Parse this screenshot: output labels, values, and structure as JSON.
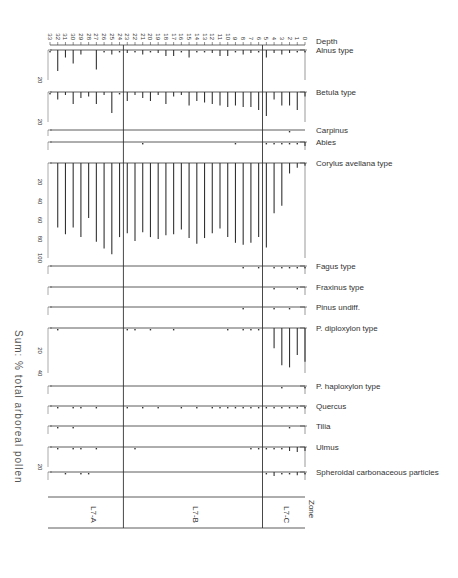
{
  "chart_data": {
    "type": "bar",
    "subtype": "pollen-stratigraphic-diagram (rotated 90°)",
    "depth_axis": {
      "label": "Depth",
      "ticks": [
        33,
        32,
        31,
        30,
        29,
        28,
        27,
        26,
        25,
        24,
        23,
        22,
        21,
        20,
        19,
        18,
        17,
        16,
        15,
        14,
        13,
        12,
        11,
        10,
        9,
        8,
        7,
        6,
        5,
        4,
        3,
        2,
        1,
        0
      ]
    },
    "sum_label": "Sum: % total arboreal pollen",
    "zones": {
      "label": "Zone",
      "items": [
        {
          "name": "L7-A",
          "from_depth": 33,
          "to_depth": 24.5
        },
        {
          "name": "L7-B",
          "from_depth": 24.5,
          "to_depth": 6.5
        },
        {
          "name": "L7-C",
          "from_depth": 6.5,
          "to_depth": 0
        }
      ]
    },
    "series": [
      {
        "name": "Alnus type",
        "scale_max": 20,
        "values": [
          1,
          14,
          5,
          9,
          3,
          0,
          13,
          1,
          3,
          1,
          2,
          1,
          3,
          1,
          2,
          4,
          4,
          1,
          5,
          1,
          1,
          2,
          4,
          4,
          1,
          3,
          2,
          1,
          5,
          2,
          3,
          2,
          1,
          1
        ]
      },
      {
        "name": "Betula type",
        "scale_max": 20,
        "values": [
          1,
          5,
          2,
          8,
          4,
          3,
          8,
          2,
          14,
          1,
          6,
          2,
          4,
          6,
          2,
          8,
          3,
          2,
          9,
          6,
          7,
          8,
          9,
          10,
          9,
          10,
          10,
          12,
          16,
          5,
          9,
          9,
          12,
          3
        ]
      },
      {
        "name": "Carpinus",
        "scale_max": 1,
        "values": [
          0,
          0,
          0,
          0,
          0,
          0,
          0,
          0,
          0,
          0,
          0,
          0,
          0,
          0,
          0,
          0,
          0,
          0,
          0,
          0,
          0,
          0,
          0,
          0,
          0,
          0,
          0,
          0,
          0,
          0,
          0,
          0.3,
          0,
          0
        ]
      },
      {
        "name": "Abies",
        "scale_max": 2,
        "values": [
          0,
          0,
          0,
          0,
          0,
          0,
          0,
          0,
          0,
          0,
          0,
          0,
          0.3,
          0,
          0,
          0,
          0,
          0,
          0,
          0,
          0,
          0,
          0,
          0,
          0.3,
          0,
          0,
          0,
          0.3,
          0.5,
          0.5,
          0.5,
          0.5,
          1
        ]
      },
      {
        "name": "Corylus avellana type",
        "scale_max": 100,
        "values": [
          0,
          68,
          75,
          68,
          78,
          58,
          83,
          90,
          96,
          78,
          74,
          82,
          73,
          78,
          80,
          76,
          75,
          70,
          79,
          85,
          79,
          74,
          69,
          78,
          84,
          86,
          84,
          78,
          89,
          53,
          45,
          11,
          5,
          3
        ]
      },
      {
        "name": "Fagus type",
        "scale_max": 2,
        "values": [
          0,
          0,
          0,
          0,
          0,
          0,
          0,
          0,
          0,
          0,
          0,
          0,
          0,
          0,
          0,
          0,
          0,
          0,
          0,
          0,
          0,
          0,
          0,
          0,
          0,
          0.3,
          0,
          0.3,
          0,
          0.3,
          0.5,
          0.5,
          0.5,
          0.5
        ]
      },
      {
        "name": "Fraxinus type",
        "scale_max": 2,
        "values": [
          0,
          0,
          0,
          0,
          0,
          0,
          0,
          0,
          0,
          0,
          0,
          0,
          0,
          0,
          0,
          0,
          0,
          0,
          0,
          0,
          0,
          0,
          0,
          0,
          0,
          0,
          0,
          0,
          0,
          0.3,
          0,
          0,
          0.3,
          0
        ]
      },
      {
        "name": "Pinus undiff.",
        "scale_max": 2,
        "values": [
          0,
          0,
          0,
          0,
          0,
          0,
          0,
          0,
          0,
          0,
          0,
          0,
          0,
          0,
          0,
          0,
          0,
          0,
          0,
          0,
          0,
          0,
          0,
          0,
          0,
          0.3,
          0,
          0,
          0,
          0.3,
          0,
          0.3,
          0,
          0
        ]
      },
      {
        "name": "P. diploxylon type",
        "scale_max": 40,
        "values": [
          0,
          0.5,
          0,
          0,
          0,
          0,
          0,
          0,
          0,
          0,
          0.5,
          0.5,
          0,
          0.5,
          0,
          0,
          0.5,
          0,
          0,
          0,
          0,
          0,
          0,
          0.5,
          0,
          0.5,
          0.5,
          0.5,
          0,
          18,
          33,
          35,
          24,
          30
        ]
      },
      {
        "name": "P. haploxylon type",
        "scale_max": 2,
        "values": [
          0,
          0,
          0,
          0,
          0,
          0,
          0,
          0,
          0,
          0,
          0,
          0,
          0,
          0,
          0,
          0,
          0,
          0,
          0,
          0,
          0,
          0,
          0,
          0,
          0,
          0,
          0,
          0,
          0,
          0,
          0.3,
          0,
          0,
          0.3
        ]
      },
      {
        "name": "Quercus",
        "scale_max": 2,
        "values": [
          0,
          0.5,
          0,
          0.5,
          0.5,
          0,
          0.3,
          0,
          0,
          0,
          0.5,
          0,
          0.3,
          0,
          0.3,
          0,
          0,
          0.3,
          0,
          0.3,
          0,
          0.3,
          0.3,
          0.3,
          0.5,
          0.5,
          0.3,
          0.5,
          0.5,
          0.5,
          0.3,
          0.5,
          0.5,
          0.5
        ]
      },
      {
        "name": "Tilia",
        "scale_max": 2,
        "values": [
          0,
          0.3,
          0,
          0.3,
          0,
          0,
          0,
          0,
          0,
          0,
          0,
          0,
          0,
          0,
          0,
          0,
          0,
          0,
          0,
          0,
          0,
          0,
          0,
          0,
          0,
          0,
          0,
          0,
          0,
          0,
          0,
          0.3,
          0,
          0
        ]
      },
      {
        "name": "Ulmus",
        "scale_max": 20,
        "values": [
          0,
          0.5,
          0,
          0.5,
          0.5,
          0,
          0.5,
          0,
          0,
          0,
          0,
          0.5,
          0,
          0,
          0,
          0,
          0,
          0,
          0,
          0,
          0,
          0,
          0,
          0,
          0,
          0,
          0.5,
          0.5,
          0.5,
          1,
          1,
          4,
          5,
          4
        ]
      },
      {
        "name": "Spheroidal carbonaceous particles",
        "scale_max": 2,
        "values": [
          0,
          0,
          0.3,
          0,
          0.3,
          0.3,
          0,
          0,
          0,
          0,
          0,
          0,
          0,
          0,
          0,
          0,
          0,
          0,
          0,
          0,
          0,
          0,
          0,
          0,
          0,
          0,
          0,
          0,
          0.3,
          1,
          0.5,
          0.5,
          0.8,
          0.5
        ]
      }
    ],
    "title": "",
    "xlabel": "Depth",
    "ylabel": "Sum: % total arboreal pollen",
    "grid": false,
    "legend": "taxon labels at right of each panel"
  },
  "labels": {
    "depth": "Depth",
    "zone": "Zone",
    "sum": "Sum: % total arboreal pollen",
    "zone_names": [
      "L7-A",
      "L7-B",
      "L7-C"
    ]
  }
}
